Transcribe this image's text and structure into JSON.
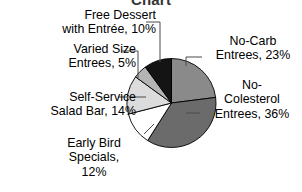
{
  "chart_data": {
    "type": "pie",
    "title": "Chart",
    "title_clipped": true,
    "labels": [
      "No-Carb Entrees",
      "No-Colesterol Entrees",
      "Early Bird Specials",
      "Self-Service Salad Bar",
      "Varied Size Entrees",
      "Free Dessert with Entrée"
    ],
    "values": [
      23,
      36,
      12,
      14,
      5,
      10
    ],
    "value_suffix": "%",
    "colors": [
      "#8a8a8a",
      "#6b6b6b",
      "#ffffff",
      "#dcdcdc",
      "#b4b4b4",
      "#141414"
    ],
    "slice_border_color": "#000000",
    "start_angle_deg": 0,
    "direction": "clockwise",
    "legend": "none",
    "labels_position": "outside-with-leader-lines",
    "grid": false,
    "xlabel": "",
    "ylabel": "",
    "slices": [
      {
        "name": "No-Carb Entrees",
        "value": 23,
        "color": "#8a8a8a"
      },
      {
        "name": "No-Colesterol Entrees",
        "value": 36,
        "color": "#6b6b6b"
      },
      {
        "name": "Early Bird Specials",
        "value": 12,
        "color": "#ffffff"
      },
      {
        "name": "Self-Service Salad Bar",
        "value": 14,
        "color": "#dcdcdc"
      },
      {
        "name": "Varied Size Entrees",
        "value": 5,
        "color": "#b4b4b4"
      },
      {
        "name": "Free Dessert with Entrée",
        "value": 10,
        "color": "#141414"
      }
    ]
  },
  "title": "Chart",
  "callouts": {
    "free_dessert": "Free Dessert\nwith Entrée, 10%",
    "varied_size": "Varied Size\nEntrees, 5%",
    "self_service": "Self-Service\nSalad Bar, 14%",
    "early_bird": "Early Bird\nSpecials,\n12%",
    "no_carb": "No-Carb\nEntrees, 23%",
    "no_colesterol": "No-\nColesterol\nEntrees, 36%"
  }
}
